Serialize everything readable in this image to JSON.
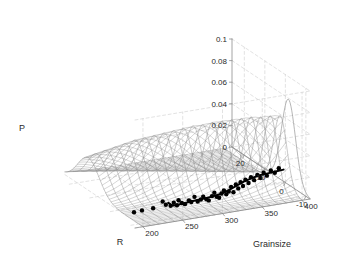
{
  "figure": {
    "background": "#ffffff",
    "width": 341,
    "height": 263
  },
  "chart_data": {
    "type": "line",
    "subtype": "3d-surface-mesh-with-scatter-and-fitted-curve",
    "title": "",
    "xlabel": "R",
    "ylabel": "Grainsize",
    "zlabel": "P",
    "grid": true,
    "legend": null,
    "xlim": [
      -12,
      26
    ],
    "ylim": [
      190,
      410
    ],
    "zlim": [
      0,
      0.1
    ],
    "xticks": [
      20,
      10,
      0,
      -10
    ],
    "xticklabels": [
      "20",
      "10",
      "0",
      "-10"
    ],
    "yticks": [
      200,
      250,
      300,
      350,
      400
    ],
    "yticklabels": [
      "200",
      "250",
      "300",
      "350",
      "400"
    ],
    "zticks": [
      0,
      0.02,
      0.04,
      0.06,
      0.08,
      0.1
    ],
    "zticklabels": [
      "0",
      "0.02",
      "0.04",
      "0.06",
      "0.08",
      "0.1"
    ],
    "surface": {
      "description": "Mesh of bell-shaped probability ridges P(R) for each Grainsize",
      "color": "#8a8a8a",
      "grainsize_slices": [
        200,
        210,
        220,
        230,
        240,
        250,
        260,
        270,
        280,
        290,
        300,
        310,
        320,
        330,
        340,
        350,
        360,
        370,
        380,
        390,
        400
      ],
      "peak_P": [
        0.03,
        0.033,
        0.036,
        0.039,
        0.042,
        0.045,
        0.047,
        0.049,
        0.051,
        0.053,
        0.055,
        0.057,
        0.058,
        0.06,
        0.061,
        0.062,
        0.063,
        0.064,
        0.064,
        0.065,
        0.065
      ],
      "peak_R": [
        14.5,
        13.8,
        13.0,
        12.2,
        11.4,
        10.6,
        9.8,
        9.0,
        8.2,
        7.4,
        6.6,
        5.8,
        5.0,
        4.2,
        3.4,
        2.6,
        1.8,
        1.0,
        0.2,
        -0.6,
        -1.4
      ],
      "peak_width_R": [
        5.2,
        5.1,
        5.0,
        4.9,
        4.8,
        4.7,
        4.6,
        4.5,
        4.4,
        4.3,
        4.2,
        4.1,
        4.0,
        3.9,
        3.8,
        3.7,
        3.6,
        3.5,
        3.4,
        3.3,
        3.2
      ]
    },
    "front_profile_curve": {
      "description": "Tall light-grey profile curve drawn at the front-right edge reaching ~0.08",
      "color": "#9e9e9e",
      "peak_P": 0.079,
      "peak_R": -1.5
    },
    "fitted_curve": {
      "description": "Thick black fitted ridge/mean curve along Grainsize at the base",
      "color": "#000000",
      "linewidth": 2.0,
      "grainsize": [
        255,
        260,
        266,
        272,
        280,
        290,
        300,
        310,
        320,
        330,
        340,
        350,
        360,
        370,
        380,
        390,
        400
      ],
      "P": [
        0.004,
        0.001,
        0.0005,
        0.001,
        0.0015,
        0.002,
        0.0025,
        0.003,
        0.004,
        0.006,
        0.009,
        0.012,
        0.014,
        0.0155,
        0.016,
        0.0165,
        0.017
      ]
    },
    "scatter": {
      "description": "Observed data points (Grainsize, P) projected near the base plane",
      "marker": "filled-circle",
      "color": "#000000",
      "size": 2.2,
      "points": [
        [
          212,
          0.0005
        ],
        [
          222,
          0.001
        ],
        [
          236,
          0.0012
        ],
        [
          248,
          0.006
        ],
        [
          252,
          0.0025
        ],
        [
          258,
          0.0008
        ],
        [
          262,
          0.0032
        ],
        [
          266,
          0.0004
        ],
        [
          268,
          0.0048
        ],
        [
          272,
          0.0018
        ],
        [
          276,
          0.0002
        ],
        [
          281,
          0.0031
        ],
        [
          284,
          0.0012
        ],
        [
          288,
          0.0055
        ],
        [
          292,
          0.0006
        ],
        [
          296,
          0.002
        ],
        [
          299,
          0.0042
        ],
        [
          303,
          0.0014
        ],
        [
          306,
          0.0
        ],
        [
          310,
          0.0035
        ],
        [
          313,
          0.0062
        ],
        [
          316,
          0.0021
        ],
        [
          319,
          0.0008
        ],
        [
          322,
          0.0044
        ],
        [
          325,
          0.007
        ],
        [
          328,
          0.0029
        ],
        [
          331,
          0.0052
        ],
        [
          334,
          0.009
        ],
        [
          337,
          0.0038
        ],
        [
          340,
          0.0105
        ],
        [
          343,
          0.0066
        ],
        [
          346,
          0.012
        ],
        [
          349,
          0.0081
        ],
        [
          352,
          0.0135
        ],
        [
          356,
          0.01
        ],
        [
          359,
          0.015
        ],
        [
          363,
          0.0118
        ],
        [
          367,
          0.016
        ],
        [
          371,
          0.0128
        ],
        [
          375,
          0.0172
        ],
        [
          379,
          0.014
        ],
        [
          384,
          0.0182
        ],
        [
          389,
          0.0155
        ],
        [
          394,
          0.019
        ]
      ]
    }
  },
  "axes": {
    "z_axis_label": "P",
    "x_axis_label": "R",
    "y_axis_label": "Grainsize"
  }
}
